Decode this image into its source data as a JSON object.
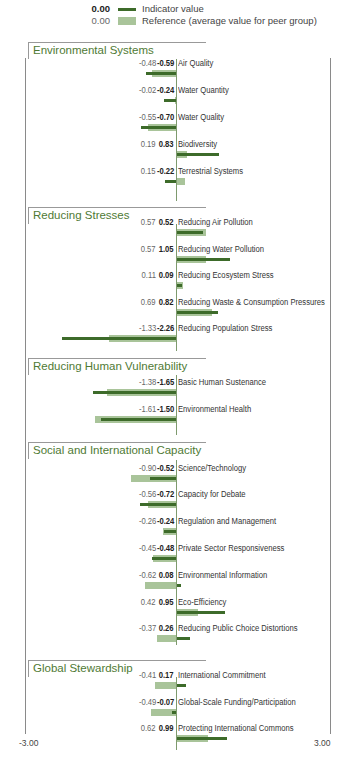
{
  "legend": {
    "indicator": {
      "value": "0.00",
      "label": "Indicator value",
      "color": "#3d6b2a"
    },
    "reference": {
      "value": "0.00",
      "label": "Reference (average value for peer group)",
      "color": "#a9c49a"
    }
  },
  "axis": {
    "min_label": "-3.00",
    "max_label": "3.00"
  },
  "sections": [
    {
      "title": "Environmental Systems"
    },
    {
      "title": "Reducing Stresses"
    },
    {
      "title": "Reducing Human Vulnerability"
    },
    {
      "title": "Social and International Capacity"
    },
    {
      "title": "Global Stewardship"
    }
  ],
  "rows": [
    {
      "name": "Air Quality",
      "ref": "-0.48",
      "ind": "-0.59"
    },
    {
      "name": "Water Quantity",
      "ref": "-0.02",
      "ind": "-0.24"
    },
    {
      "name": "Water Quality",
      "ref": "-0.55",
      "ind": "-0.70"
    },
    {
      "name": "Biodiversity",
      "ref": "0.19",
      "ind": "0.83"
    },
    {
      "name": "Terrestrial Systems",
      "ref": "0.15",
      "ind": "-0.22"
    },
    {
      "name": "Reducing Air Pollution",
      "ref": "0.57",
      "ind": "0.52"
    },
    {
      "name": "Reducing Water Pollution",
      "ref": "0.57",
      "ind": "1.05"
    },
    {
      "name": "Reducing Ecosystem Stress",
      "ref": "0.11",
      "ind": "0.09"
    },
    {
      "name": "Reducing Waste & Consumption Pressures",
      "ref": "0.69",
      "ind": "0.82"
    },
    {
      "name": "Reducing Population Stress",
      "ref": "-1.33",
      "ind": "-2.26"
    },
    {
      "name": "Basic Human Sustenance",
      "ref": "-1.38",
      "ind": "-1.65"
    },
    {
      "name": "Environmental Health",
      "ref": "-1.61",
      "ind": "-1.50"
    },
    {
      "name": "Science/Technology",
      "ref": "-0.90",
      "ind": "-0.52"
    },
    {
      "name": "Capacity for Debate",
      "ref": "-0.56",
      "ind": "-0.72"
    },
    {
      "name": "Regulation and Management",
      "ref": "-0.26",
      "ind": "-0.24"
    },
    {
      "name": "Private Sector Responsiveness",
      "ref": "-0.45",
      "ind": "-0.48"
    },
    {
      "name": "Environmental Information",
      "ref": "-0.62",
      "ind": "0.08"
    },
    {
      "name": "Eco-Efficiency",
      "ref": "0.42",
      "ind": "0.95"
    },
    {
      "name": "Reducing Public Choice Distortions",
      "ref": "-0.37",
      "ind": "0.26"
    },
    {
      "name": "International Commitment",
      "ref": "-0.41",
      "ind": "0.17"
    },
    {
      "name": "Global-Scale Funding/Participation",
      "ref": "-0.49",
      "ind": "-0.07"
    },
    {
      "name": "Protecting International Commons",
      "ref": "0.62",
      "ind": "0.99"
    }
  ],
  "chart_data": {
    "type": "bar",
    "orientation": "horizontal",
    "title": "",
    "xlabel": "",
    "ylabel": "",
    "xlim": [
      -3.0,
      3.0
    ],
    "grid": false,
    "legend_position": "top",
    "groups": [
      {
        "name": "Environmental Systems",
        "categories": [
          "Air Quality",
          "Water Quantity",
          "Water Quality",
          "Biodiversity",
          "Terrestrial Systems"
        ]
      },
      {
        "name": "Reducing Stresses",
        "categories": [
          "Reducing Air Pollution",
          "Reducing Water Pollution",
          "Reducing Ecosystem Stress",
          "Reducing Waste & Consumption Pressures",
          "Reducing Population Stress"
        ]
      },
      {
        "name": "Reducing Human Vulnerability",
        "categories": [
          "Basic Human Sustenance",
          "Environmental Health"
        ]
      },
      {
        "name": "Social and International Capacity",
        "categories": [
          "Science/Technology",
          "Capacity for Debate",
          "Regulation and Management",
          "Private Sector Responsiveness",
          "Environmental Information",
          "Eco-Efficiency",
          "Reducing Public Choice Distortions"
        ]
      },
      {
        "name": "Global Stewardship",
        "categories": [
          "International Commitment",
          "Global-Scale Funding/Participation",
          "Protecting International Commons"
        ]
      }
    ],
    "categories": [
      "Air Quality",
      "Water Quantity",
      "Water Quality",
      "Biodiversity",
      "Terrestrial Systems",
      "Reducing Air Pollution",
      "Reducing Water Pollution",
      "Reducing Ecosystem Stress",
      "Reducing Waste & Consumption Pressures",
      "Reducing Population Stress",
      "Basic Human Sustenance",
      "Environmental Health",
      "Science/Technology",
      "Capacity for Debate",
      "Regulation and Management",
      "Private Sector Responsiveness",
      "Environmental Information",
      "Eco-Efficiency",
      "Reducing Public Choice Distortions",
      "International Commitment",
      "Global-Scale Funding/Participation",
      "Protecting International Commons"
    ],
    "series": [
      {
        "name": "Indicator value",
        "color": "#3d6b2a",
        "values": [
          -0.59,
          -0.24,
          -0.7,
          0.83,
          -0.22,
          0.52,
          1.05,
          0.09,
          0.82,
          -2.26,
          -1.65,
          -1.5,
          -0.52,
          -0.72,
          -0.24,
          -0.48,
          0.08,
          0.95,
          0.26,
          0.17,
          -0.07,
          0.99
        ]
      },
      {
        "name": "Reference (average value for peer group)",
        "color": "#a9c49a",
        "values": [
          -0.48,
          -0.02,
          -0.55,
          0.19,
          0.15,
          0.57,
          0.57,
          0.11,
          0.69,
          -1.33,
          -1.38,
          -1.61,
          -0.9,
          -0.56,
          -0.26,
          -0.45,
          -0.62,
          0.42,
          -0.37,
          -0.41,
          -0.49,
          0.62
        ]
      }
    ]
  }
}
